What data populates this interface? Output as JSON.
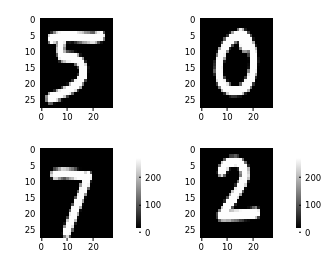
{
  "figure": {
    "background_color": "#ffffff",
    "width": 331,
    "height": 269,
    "rows": 2,
    "cols": 2,
    "colormap": "gray"
  },
  "chart_data": {
    "type": "heatmap",
    "title": "",
    "xlabel": "",
    "ylabel": "",
    "colormap": "gray",
    "grid": false,
    "legend_position": "none",
    "shared_xticks": [
      0,
      10,
      20
    ],
    "shared_yticks": [
      0,
      5,
      10,
      15,
      20,
      25
    ],
    "xlim": [
      -0.5,
      27.5
    ],
    "ylim": [
      27.5,
      -0.5
    ],
    "value_range": [
      0,
      255
    ],
    "colorbar_ticks": [
      0,
      100,
      200
    ],
    "panels": [
      {
        "name": "panel-digit-5",
        "label": "5",
        "position": "top-left",
        "has_colorbar": false,
        "xticks": [
          0,
          10,
          20
        ],
        "yticks": [
          0,
          5,
          10,
          15,
          20,
          25
        ],
        "width": 28,
        "height": 28,
        "pixels": "000000000000000000000000000000000000000000000000000000000000000000000000000000000000000000000000000000000000000000000000000000000000000000000000000000000000000000000000000000000000000000000000000000000000000000000000000000000000000000000000000000000000000000000000000000000000000000000000000000000000000000000000000000000000000000000000000000000000000000000000000000000000000000000000000000000000000000000000000000000000000000000000000000000000000003182521533172532531231260000000000000000000000000000003025425425425425425325225225225164600000000000000000000000000000000000000000000000000000000000000000000000000000000000000000000000000000000000000000000000000000000000000000000000000000000000000000000000000000000000000000000000000000000000000000000000000000000000000000000000000000000000000000000000000000000000000000000000000000000000000000000000000000000000000000000000000000000000000000000000000000000000000000000000000000000000000000000000000000000000000000000000000000000000000000000000000000000000000000000000000000000000000000000000000000000000000000000000000000000000000000000000000000000000000000000000000000000000000000000000000000000000000000000000000000000"
      },
      {
        "name": "panel-digit-0",
        "label": "0",
        "position": "top-right",
        "has_colorbar": false,
        "xticks": [
          0,
          10,
          20
        ],
        "yticks": [
          0,
          5,
          10,
          15,
          20,
          25
        ],
        "width": 28,
        "height": 28
      },
      {
        "name": "panel-digit-7",
        "label": "7",
        "position": "bottom-left",
        "has_colorbar": true,
        "xticks": [
          0,
          10,
          20
        ],
        "yticks": [
          0,
          5,
          10,
          15,
          20,
          25
        ],
        "width": 28,
        "height": 28
      },
      {
        "name": "panel-digit-2",
        "label": "2",
        "position": "bottom-right",
        "has_colorbar": true,
        "xticks": [
          0,
          10,
          20
        ],
        "yticks": [
          0,
          5,
          10,
          15,
          20,
          25
        ],
        "width": 28,
        "height": 28
      }
    ]
  },
  "ticks": {
    "x": [
      "0",
      "10",
      "20"
    ],
    "y": [
      "0",
      "5",
      "10",
      "15",
      "20",
      "25"
    ],
    "colorbar": [
      "200",
      "100",
      "0"
    ]
  }
}
